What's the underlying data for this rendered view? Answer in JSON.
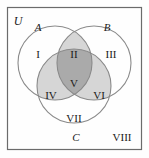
{
  "figure": {
    "type": "venn-diagram-3-set",
    "width": 149,
    "height": 158,
    "background_color": "#fefefe",
    "border_color": "#6b6b6b",
    "circle_stroke_color": "#8a8a8a",
    "text_color": "#1a1a1a"
  },
  "universe": {
    "label": "U",
    "rect": {
      "x": 7,
      "y": 7,
      "width": 135,
      "height": 143
    },
    "label_position": {
      "x": 18,
      "y": 25
    }
  },
  "sets": [
    {
      "name": "set-a",
      "label": "A",
      "circle": {
        "cx": 55,
        "cy": 63,
        "r": 37
      },
      "label_position": {
        "x": 38,
        "y": 31
      }
    },
    {
      "name": "set-b",
      "label": "B",
      "circle": {
        "cx": 94,
        "cy": 63,
        "r": 37
      },
      "label_position": {
        "x": 106,
        "y": 31
      }
    },
    {
      "name": "set-c",
      "label": "C",
      "circle": {
        "cx": 74,
        "cy": 86,
        "r": 37
      },
      "label_position": {
        "x": 76,
        "y": 141
      }
    }
  ],
  "regions": [
    {
      "name": "region-i",
      "label": "I",
      "description": "A only",
      "fill": "none",
      "shaded": false,
      "label_position": {
        "x": 38,
        "y": 55
      }
    },
    {
      "name": "region-ii",
      "label": "II",
      "description": "A intersect B, not C",
      "fill": "#d6d6d6",
      "shaded": true,
      "label_position": {
        "x": 74,
        "y": 55
      }
    },
    {
      "name": "region-iii",
      "label": "III",
      "description": "B only",
      "fill": "none",
      "shaded": false,
      "label_position": {
        "x": 110,
        "y": 55
      }
    },
    {
      "name": "region-iv",
      "label": "IV",
      "description": "A intersect C, not B",
      "fill": "#d6d6d6",
      "shaded": true,
      "label_position": {
        "x": 51,
        "y": 95
      }
    },
    {
      "name": "region-v",
      "label": "V",
      "description": "A intersect B intersect C",
      "fill": "#aaaaaa",
      "shaded": true,
      "label_position": {
        "x": 74,
        "y": 83
      }
    },
    {
      "name": "region-vi",
      "label": "VI",
      "description": "B intersect C, not A",
      "fill": "#d6d6d6",
      "shaded": true,
      "label_position": {
        "x": 98,
        "y": 95
      }
    },
    {
      "name": "region-vii",
      "label": "VII",
      "description": "C only",
      "fill": "none",
      "shaded": false,
      "label_position": {
        "x": 74,
        "y": 119
      }
    },
    {
      "name": "region-viii",
      "label": "VIII",
      "description": "outside all sets, inside U",
      "fill": "none",
      "shaded": false,
      "label_position": {
        "x": 121,
        "y": 138
      }
    }
  ]
}
